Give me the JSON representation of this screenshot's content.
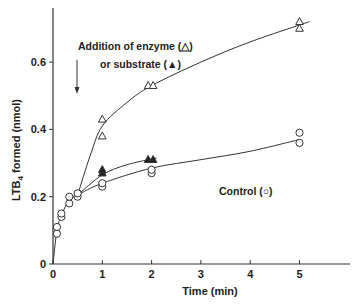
{
  "chart_data": {
    "type": "scatter",
    "title": "",
    "xlabel": "Time (min)",
    "ylabel": "LTB4 formed (nmol)",
    "ylabel_main": "LTB",
    "ylabel_sub": "4",
    "ylabel_rest": " formed  (nmol)",
    "xlim": [
      0,
      6
    ],
    "ylim": [
      0,
      0.76
    ],
    "xticks": [
      0,
      1,
      2,
      3,
      4,
      5
    ],
    "xtick_labels": [
      "0",
      "1",
      "2",
      "3",
      "4",
      "5"
    ],
    "yticks": [
      0,
      0.2,
      0.4,
      0.6
    ],
    "ytick_labels": [
      "0",
      "0.2",
      "0.4",
      "0.6"
    ],
    "grid": false,
    "legend": "inline annotations",
    "annotations": {
      "addition_line1": "Addition of enzyme (△)",
      "addition_line2": "or substrate (▲)",
      "control": "Control (○)",
      "arrow_at_x": 0.5
    },
    "series": [
      {
        "name": "Control",
        "marker": "open-circle",
        "points": [
          [
            0.08,
            0.09
          ],
          [
            0.08,
            0.11
          ],
          [
            0.17,
            0.14
          ],
          [
            0.17,
            0.15
          ],
          [
            0.33,
            0.18
          ],
          [
            0.33,
            0.2
          ],
          [
            0.5,
            0.2
          ],
          [
            0.5,
            0.21
          ],
          [
            1,
            0.23
          ],
          [
            1,
            0.24
          ],
          [
            2,
            0.27
          ],
          [
            2,
            0.28
          ],
          [
            5,
            0.36
          ],
          [
            5,
            0.39
          ]
        ],
        "curve": [
          [
            0,
            0
          ],
          [
            0.08,
            0.1
          ],
          [
            0.17,
            0.145
          ],
          [
            0.33,
            0.19
          ],
          [
            0.5,
            0.205
          ],
          [
            1,
            0.24
          ],
          [
            2,
            0.285
          ],
          [
            3,
            0.31
          ],
          [
            4,
            0.335
          ],
          [
            5,
            0.37
          ]
        ]
      },
      {
        "name": "Addition of substrate",
        "marker": "filled-triangle",
        "points": [
          [
            1,
            0.27
          ],
          [
            1,
            0.28
          ],
          [
            1.93,
            0.31
          ],
          [
            2.03,
            0.31
          ]
        ],
        "curve": [
          [
            0.5,
            0.205
          ],
          [
            1,
            0.265
          ],
          [
            1.5,
            0.295
          ],
          [
            2.1,
            0.315
          ]
        ]
      },
      {
        "name": "Addition of enzyme",
        "marker": "open-triangle",
        "points": [
          [
            1,
            0.38
          ],
          [
            1,
            0.43
          ],
          [
            1.93,
            0.53
          ],
          [
            2.03,
            0.53
          ],
          [
            5,
            0.7
          ],
          [
            5,
            0.72
          ]
        ],
        "curve": [
          [
            0.5,
            0.205
          ],
          [
            0.75,
            0.32
          ],
          [
            1,
            0.41
          ],
          [
            1.5,
            0.48
          ],
          [
            2,
            0.53
          ],
          [
            3,
            0.6
          ],
          [
            4,
            0.66
          ],
          [
            5.2,
            0.72
          ]
        ]
      }
    ]
  }
}
